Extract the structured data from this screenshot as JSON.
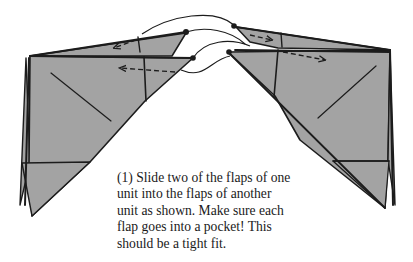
{
  "figure": {
    "type": "origami-instruction-diagram",
    "step_number": "(1)",
    "caption_lines": [
      "(1) Slide two of the flaps of one",
      "unit into the flaps of another",
      "unit as shown.  Make sure each",
      "flap goes into a pocket!  This",
      "should be a tight fit."
    ],
    "caption": "(1) Slide two of the flaps of one\nunit into the flaps of another\nunit as shown.  Make sure each\nflap goes into a pocket!  This\nshould be a tight fit.",
    "colors": {
      "paper": "#a3a3a3",
      "line": "#1c1c1c",
      "background": "#ffffff"
    },
    "elements": [
      {
        "name": "left-unit",
        "description": "folded paper unit with two flaps pointing right"
      },
      {
        "name": "right-unit",
        "description": "folded paper unit with two pockets opening left"
      },
      {
        "name": "insertion-curves",
        "description": "curved guide lines linking flap tips to pocket dots"
      },
      {
        "name": "dashed-arrows",
        "count": 4,
        "description": "dashed arrows showing flap slide direction"
      }
    ]
  }
}
